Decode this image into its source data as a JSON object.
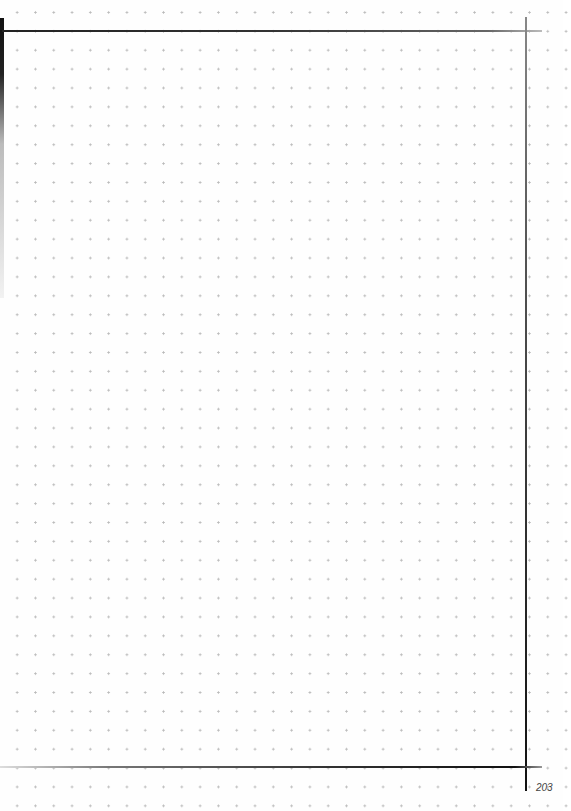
{
  "page": {
    "type": "dot-grid notebook page",
    "page_number": "203",
    "dot_color": "#b9b9b9",
    "line_color": "#111111"
  }
}
